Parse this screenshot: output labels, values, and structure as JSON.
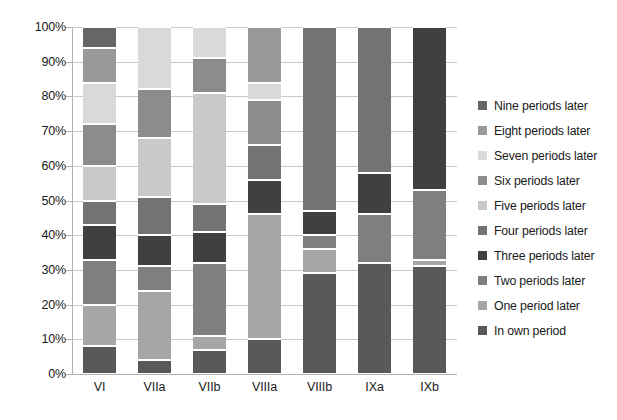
{
  "chart_data": {
    "type": "bar",
    "subtype": "stacked-100-percent",
    "title": "",
    "xlabel": "",
    "ylabel": "",
    "ylim": [
      0,
      100
    ],
    "grid": true,
    "legend_position": "right",
    "categories": [
      "VI",
      "VIIa",
      "VIIb",
      "VIIIa",
      "VIIIb",
      "IXa",
      "IXb"
    ],
    "y_ticks": [
      "0%",
      "10%",
      "20%",
      "30%",
      "40%",
      "50%",
      "60%",
      "70%",
      "80%",
      "90%",
      "100%"
    ],
    "y_tick_values": [
      0,
      10,
      20,
      30,
      40,
      50,
      60,
      70,
      80,
      90,
      100
    ],
    "series": [
      {
        "name": "In own period",
        "color": "#595959",
        "values": [
          8,
          4,
          7,
          10,
          29,
          32,
          31
        ]
      },
      {
        "name": "One period later",
        "color": "#a6a6a6",
        "values": [
          12,
          20,
          4,
          36,
          7,
          0,
          2
        ]
      },
      {
        "name": "Two periods later",
        "color": "#7f7f7f",
        "values": [
          13,
          7,
          21,
          0,
          4,
          14,
          20
        ]
      },
      {
        "name": "Three periods later",
        "color": "#404040",
        "values": [
          10,
          9,
          9,
          10,
          7,
          12,
          47
        ]
      },
      {
        "name": "Four periods later",
        "color": "#737373",
        "values": [
          7,
          11,
          8,
          10,
          53,
          42,
          0
        ]
      },
      {
        "name": "Five periods later",
        "color": "#c9c9c9",
        "values": [
          10,
          17,
          32,
          0,
          0,
          0,
          0
        ]
      },
      {
        "name": "Six periods later",
        "color": "#8c8c8c",
        "values": [
          12,
          14,
          10,
          13,
          0,
          0,
          0
        ]
      },
      {
        "name": "Seven periods later",
        "color": "#d9d9d9",
        "values": [
          12,
          18,
          9,
          5,
          0,
          0,
          0
        ]
      },
      {
        "name": "Eight periods later",
        "color": "#999999",
        "values": [
          10,
          0,
          0,
          16,
          0,
          0,
          0
        ]
      },
      {
        "name": "Nine periods later",
        "color": "#666666",
        "values": [
          6,
          0,
          0,
          0,
          0,
          0,
          0
        ]
      }
    ],
    "legend_entries": [
      "Nine periods later",
      "Eight periods later",
      "Seven periods later",
      "Six periods later",
      "Five periods later",
      "Four periods later",
      "Three periods later",
      "Two periods later",
      "One period later",
      "In own period"
    ]
  }
}
